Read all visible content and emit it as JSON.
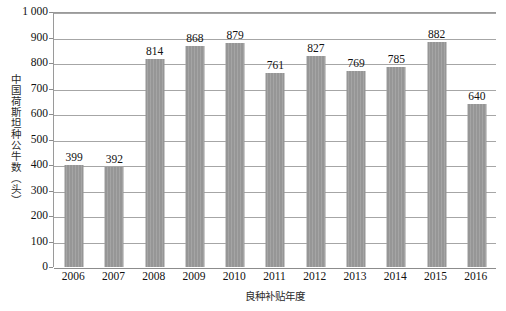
{
  "chart_data": {
    "type": "bar",
    "title": "",
    "subtitle": "",
    "xlabel": "良种补贴年度",
    "ylabel": "中国荷斯坦种公牛数（头）",
    "categories": [
      "2006",
      "2007",
      "2008",
      "2009",
      "2010",
      "2011",
      "2012",
      "2013",
      "2014",
      "2015",
      "2016"
    ],
    "values": [
      399,
      392,
      814,
      868,
      879,
      761,
      827,
      769,
      785,
      882,
      640
    ],
    "data_labels": [
      "399",
      "392",
      "814",
      "868",
      "879",
      "761",
      "827",
      "769",
      "785",
      "882",
      "640"
    ],
    "ylim": [
      0,
      1000
    ],
    "ytick_values": [
      0,
      100,
      200,
      300,
      400,
      500,
      600,
      700,
      800,
      900,
      1000
    ],
    "ytick_labels": [
      "0",
      "100",
      "200",
      "300",
      "400",
      "500",
      "600",
      "700",
      "800",
      "900",
      "1 000"
    ],
    "grid": true,
    "grid_axis": "y",
    "legend": false,
    "legend_position": "none",
    "bar_color": "#969696",
    "grid_color": "#a6a6a6",
    "axis_color": "#8c8c8c",
    "text_color": "#111111",
    "series": [
      {
        "name": "中国荷斯坦种公牛数",
        "values": [
          399,
          392,
          814,
          868,
          879,
          761,
          827,
          769,
          785,
          882,
          640
        ]
      }
    ]
  }
}
